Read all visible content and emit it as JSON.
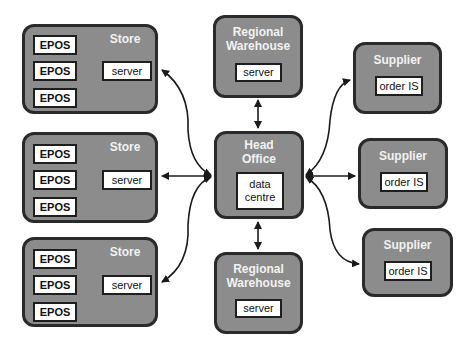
{
  "diagram": {
    "stores": [
      {
        "title": "Store",
        "server": "server",
        "epos": [
          "EPOS",
          "EPOS",
          "EPOS"
        ]
      },
      {
        "title": "Store",
        "server": "server",
        "epos": [
          "EPOS",
          "EPOS",
          "EPOS"
        ]
      },
      {
        "title": "Store",
        "server": "server",
        "epos": [
          "EPOS",
          "EPOS",
          "EPOS"
        ]
      }
    ],
    "warehouses": [
      {
        "title_line1": "Regional",
        "title_line2": "Warehouse",
        "server": "server"
      },
      {
        "title_line1": "Regional",
        "title_line2": "Warehouse",
        "server": "server"
      }
    ],
    "head_office": {
      "title_line1": "Head",
      "title_line2": "Office",
      "inner_line1": "data",
      "inner_line2": "centre"
    },
    "suppliers": [
      {
        "title": "Supplier",
        "system": "order IS"
      },
      {
        "title": "Supplier",
        "system": "order IS"
      },
      {
        "title": "Supplier",
        "system": "order IS"
      }
    ],
    "colors": {
      "node_fill": "#8c8c8c",
      "border": "#2a2a2a",
      "title_text": "#f2f2f2",
      "inner_fill": "#ffffff"
    }
  }
}
